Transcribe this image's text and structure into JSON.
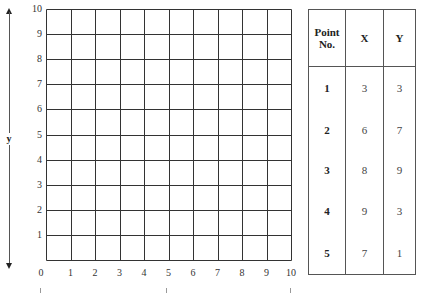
{
  "diagram": {
    "type": "coordinate-grid-worksheet",
    "grid": {
      "x_min": 0,
      "x_max": 10,
      "y_min": 0,
      "y_max": 10,
      "x_ticks": [
        "0",
        "1",
        "2",
        "3",
        "4",
        "5",
        "6",
        "7",
        "8",
        "9",
        "10"
      ],
      "y_ticks": [
        "1",
        "2",
        "3",
        "4",
        "5",
        "6",
        "7",
        "8",
        "9",
        "10"
      ],
      "line_color": "#333333"
    },
    "y_axis_label": "y",
    "table": {
      "headers": [
        "Point No.",
        "X",
        "Y"
      ],
      "header_lines": [
        [
          "Point",
          "No."
        ],
        [
          "X"
        ],
        [
          "Y"
        ]
      ],
      "rows": [
        {
          "point": "1",
          "x": "3",
          "y": "3"
        },
        {
          "point": "2",
          "x": "6",
          "y": "7"
        },
        {
          "point": "3",
          "x": "8",
          "y": "9"
        },
        {
          "point": "4",
          "x": "9",
          "y": "3"
        },
        {
          "point": "5",
          "x": "7",
          "y": "1"
        }
      ]
    }
  }
}
